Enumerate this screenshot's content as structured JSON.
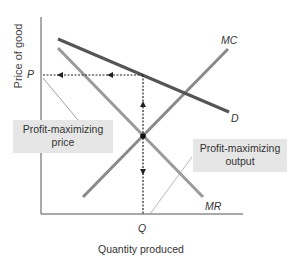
{
  "diagram": {
    "axes": {
      "y_label": "Price of good",
      "x_label": "Quantity produced",
      "y_tick": "P",
      "x_tick": "Q"
    },
    "curves": [
      {
        "id": "D",
        "label": "D",
        "name": "Demand",
        "color": "#555555"
      },
      {
        "id": "MR",
        "label": "MR",
        "name": "Marginal revenue",
        "color": "#999999"
      },
      {
        "id": "MC",
        "label": "MC",
        "name": "Marginal cost",
        "color": "#888888"
      }
    ],
    "callouts": {
      "price": {
        "line1": "Profit-maximizing",
        "line2": "price"
      },
      "output": {
        "line1": "Profit-maximizing",
        "line2": "output"
      }
    }
  }
}
